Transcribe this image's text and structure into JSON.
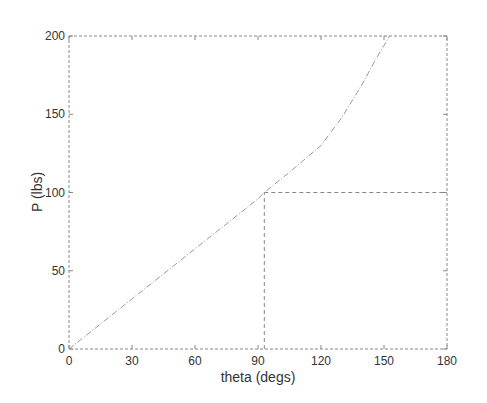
{
  "chart_data": {
    "type": "line",
    "title": "",
    "xlabel": "theta (degs)",
    "ylabel": "P (lbs)",
    "xlim": [
      0,
      180
    ],
    "ylim": [
      0,
      200
    ],
    "xticks": [
      0,
      30,
      60,
      90,
      120,
      150,
      180
    ],
    "yticks": [
      0,
      50,
      100,
      150,
      200
    ],
    "grid": false,
    "legend": null,
    "series": [
      {
        "name": "P vs theta",
        "style": "dash-dot",
        "x": [
          0,
          15,
          30,
          45,
          60,
          75,
          90,
          93,
          105,
          120,
          130,
          140,
          146,
          150,
          152.5
        ],
        "y": [
          0,
          16,
          32,
          48,
          64,
          80,
          96,
          100,
          113,
          130,
          148,
          170,
          185,
          194,
          200
        ]
      }
    ],
    "annotations": [
      {
        "type": "hline",
        "y": 100,
        "x_from": 93,
        "x_to": 180,
        "style": "dashed"
      },
      {
        "type": "vline",
        "x": 93,
        "y_from": 0,
        "y_to": 100,
        "style": "dashed"
      }
    ]
  },
  "colors": {
    "axes": "#888888",
    "curve": "#999999",
    "text": "#333333"
  }
}
